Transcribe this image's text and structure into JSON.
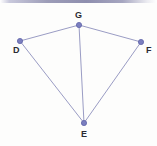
{
  "figure": {
    "width": 157,
    "height": 146,
    "background_color": "#fdfdfc",
    "edge_color": "#9a9cc4",
    "vertex_fill": "#7b7fbf",
    "vertex_stroke": "#5f63a8",
    "label_color": "#2b2b33",
    "top_bar_color": "#8e8eae",
    "vertices": [
      {
        "id": "D",
        "label": "D",
        "x": 20,
        "y": 41,
        "label_x": 13,
        "label_y": 46
      },
      {
        "id": "G",
        "label": "G",
        "x": 79,
        "y": 25,
        "label_x": 75,
        "label_y": 11
      },
      {
        "id": "F",
        "label": "F",
        "x": 141,
        "y": 42,
        "label_x": 146,
        "label_y": 46
      },
      {
        "id": "E",
        "label": "E",
        "x": 84,
        "y": 123,
        "label_x": 81,
        "label_y": 130
      }
    ],
    "edges": [
      {
        "id": "DG",
        "from": "D",
        "to": "G"
      },
      {
        "id": "GF",
        "from": "G",
        "to": "F"
      },
      {
        "id": "DE",
        "from": "D",
        "to": "E"
      },
      {
        "id": "GE",
        "from": "G",
        "to": "E"
      },
      {
        "id": "FE",
        "from": "F",
        "to": "E"
      }
    ]
  }
}
